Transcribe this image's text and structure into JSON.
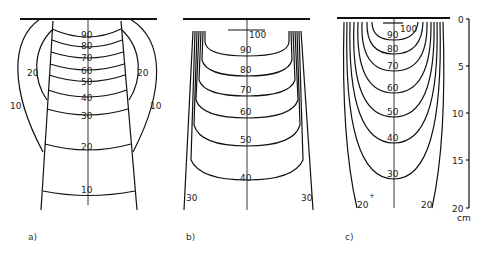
{
  "figure": {
    "panels": [
      {
        "id": "a",
        "caption": "a)",
        "isodose_labels": [
          "90",
          "80",
          "70",
          "60",
          "50",
          "40",
          "30",
          "20",
          "10"
        ],
        "side_labels": {
          "inner": "20",
          "outer": "10"
        }
      },
      {
        "id": "b",
        "caption": "b)",
        "top_label": "100",
        "isodose_labels": [
          "90",
          "80",
          "70",
          "60",
          "50",
          "40"
        ],
        "side_labels": {
          "outer": "30"
        }
      },
      {
        "id": "c",
        "caption": "c)",
        "top_label": "100",
        "isodose_labels": [
          "90",
          "80",
          "70",
          "60",
          "50",
          "40",
          "30"
        ],
        "side_labels": {
          "outer": "20"
        }
      }
    ],
    "depth_axis": {
      "ticks": [
        "0",
        "5",
        "10",
        "15",
        "20"
      ],
      "unit": "cm"
    }
  }
}
